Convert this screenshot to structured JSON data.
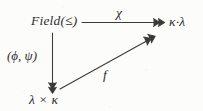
{
  "figure": {
    "kind": "commutative-diagram",
    "background_color": "#fcfcfa",
    "ink_color": "#3a3a3c",
    "width": 203,
    "height": 111,
    "nodes": [
      {
        "id": "field",
        "label": "Field(≤)",
        "x": 31,
        "y": 14,
        "position": "top-left"
      },
      {
        "id": "kappalambda",
        "label": "κ·λ",
        "x": 169,
        "y": 15,
        "position": "top-right"
      },
      {
        "id": "lambdakappa",
        "label": "λ × κ",
        "x": 29,
        "y": 93,
        "position": "bottom-left"
      }
    ],
    "edges": [
      {
        "id": "chi-edge",
        "label": "χ",
        "from": "field",
        "to": "kappalambda",
        "head": "double-head",
        "orientation": "horizontal",
        "label_x": 116,
        "label_y": 6
      },
      {
        "id": "phipsi-edge",
        "label": "(ϕ, ψ)",
        "from": "field",
        "to": "lambdakappa",
        "head": "double-head",
        "orientation": "vertical",
        "label_x": 7,
        "label_y": 49
      },
      {
        "id": "f-edge",
        "label": "f",
        "from": "lambdakappa",
        "to": "kappalambda",
        "head": "double-head",
        "orientation": "diagonal",
        "label_x": 103,
        "label_y": 68
      }
    ]
  }
}
